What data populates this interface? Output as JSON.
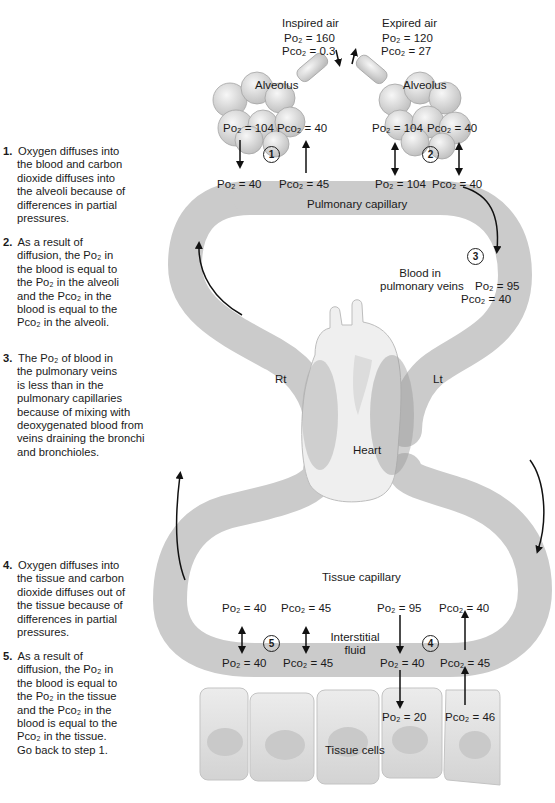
{
  "steps": [
    {
      "num": "1.",
      "lines": [
        "Oxygen diffuses into",
        "the blood and carbon",
        "dioxide diffuses into",
        "the alveoli because of",
        "differences in partial",
        "pressures."
      ]
    },
    {
      "num": "2.",
      "lines": [
        "As a result of",
        "diffusion, the Po₂ in",
        "the blood is equal to",
        "the Po₂ in the alveoli",
        "and the Pco₂ in the",
        "blood is equal to the",
        "Pco₂ in the alveoli."
      ]
    },
    {
      "num": "3.",
      "lines": [
        "The Po₂ of blood in",
        "the pulmonary veins",
        "is less than in the",
        "pulmonary capillaries",
        "because of mixing with",
        "deoxygenated blood from",
        "veins draining the bronchi",
        "and bronchioles."
      ]
    },
    {
      "num": "4.",
      "lines": [
        "Oxygen diffuses into",
        "the tissue and carbon",
        "dioxide diffuses out of",
        "the tissue because of",
        "differences in partial",
        "pressures."
      ]
    },
    {
      "num": "5.",
      "lines": [
        "As a result of",
        "diffusion, the Po₂ in",
        "the blood  is equal to",
        "the Po₂ in the tissue",
        "and the Pco₂ in the",
        "blood is equal to the",
        "Pco₂ in the tissue.",
        "Go back to step 1."
      ]
    }
  ],
  "labels": {
    "inspired_air": "Inspired air",
    "inspired_po2": "Po₂ = 160",
    "inspired_pco2": "Pco₂ = 0.3",
    "expired_air": "Expired air",
    "expired_po2": "Po₂ = 120",
    "expired_pco2": "Pco₂ = 27",
    "alveolus_left": "Alveolus",
    "alveolus_right": "Alveolus",
    "alv_left_po2": "Po₂ = 104",
    "alv_left_pco2": "Pco₂ = 40",
    "alv_right_po2": "Po₂ = 104",
    "alv_right_pco2": "Pco₂ = 40",
    "pulcap_po2_in": "Po₂ = 40",
    "pulcap_pco2_in": "Pco₂ = 45",
    "pulcap_po2_out": "Po₂ = 104",
    "pulcap_pco2_out": "Pco₂ = 40",
    "pulmonary_capillary": "Pulmonary capillary",
    "blood_in_pulmonary_veins": [
      "Blood in",
      "pulmonary veins"
    ],
    "pulvein_po2": "Po₂ = 95",
    "pulvein_pco2": "Pco₂ = 40",
    "rt": "Rt",
    "lt": "Lt",
    "heart": "Heart",
    "tissue_capillary": "Tissue capillary",
    "tiscap_po2_out": "Po₂ = 40",
    "tiscap_pco2_out": "Pco₂ = 45",
    "tiscap_po2_in": "Po₂ = 95",
    "tiscap_pco2_in": "Pco₂ = 40",
    "interstitial_fluid": [
      "Interstitial",
      "fluid"
    ],
    "if_po2_left": "Po₂ = 40",
    "if_pco2_left": "Pco₂ = 45",
    "if_po2_right": "Po₂ = 40",
    "if_pco2_right": "Pco₂ = 45",
    "cell_po2": "Po₂ = 20",
    "cell_pco2": "Pco₂ = 46",
    "tissue_cells": "Tissue cells"
  },
  "markers": [
    "1",
    "2",
    "3",
    "4",
    "5"
  ],
  "colors": {
    "vessel": "#c8c8c8",
    "heart": "#ececec",
    "text": "#1a1a1a",
    "cells": "#dedede"
  }
}
